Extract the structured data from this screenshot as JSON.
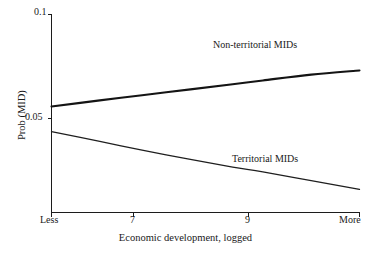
{
  "chart_data": {
    "type": "line",
    "title": "",
    "xlabel": "Economic development, logged",
    "ylabel": "Prob (MID)",
    "x_tick_labels": [
      "Less",
      "7",
      "9",
      "More"
    ],
    "x_tick_values": [
      5.5,
      7,
      9,
      10.6
    ],
    "y_tick_labels": [
      "0.1",
      "0.05"
    ],
    "y_tick_values": [
      0.1,
      0.05
    ],
    "ylim": [
      0.012,
      0.1
    ],
    "xlim": [
      5.5,
      10.6
    ],
    "grid": false,
    "legend_position": "inline-annotation",
    "series": [
      {
        "name": "Non-territorial MIDs",
        "label_x": 8.85,
        "label_y": 0.0855,
        "x": [
          5.5,
          6.3,
          7.0,
          7.8,
          8.5,
          9.0,
          9.8,
          10.6
        ],
        "values": [
          0.0558,
          0.0587,
          0.0612,
          0.064,
          0.0665,
          0.0683,
          0.0711,
          0.0731
        ]
      },
      {
        "name": "Territorial MIDs",
        "label_x": 9.2,
        "label_y": 0.0305,
        "x": [
          5.5,
          6.3,
          7.0,
          7.8,
          8.5,
          9.0,
          9.8,
          10.6
        ],
        "values": [
          0.0437,
          0.039,
          0.0348,
          0.0303,
          0.0266,
          0.0243,
          0.0201,
          0.0159
        ]
      }
    ]
  },
  "axes": {
    "y_tick_top": "0.1",
    "y_tick_mid": "0.05",
    "x_tick_less": "Less",
    "x_tick_7": "7",
    "x_tick_9": "9",
    "x_tick_more": "More",
    "x_title": "Economic development, logged",
    "y_title": "Prob (MID)"
  },
  "annotations": {
    "upper_series_label": "Non-territorial MIDs",
    "lower_series_label": "Territorial MIDs"
  },
  "colors": {
    "background": "#ffffff",
    "axis": "#1c1c1c",
    "upper_series": "#141414",
    "lower_series": "#1f1f1f",
    "text": "#1a1a1a"
  }
}
